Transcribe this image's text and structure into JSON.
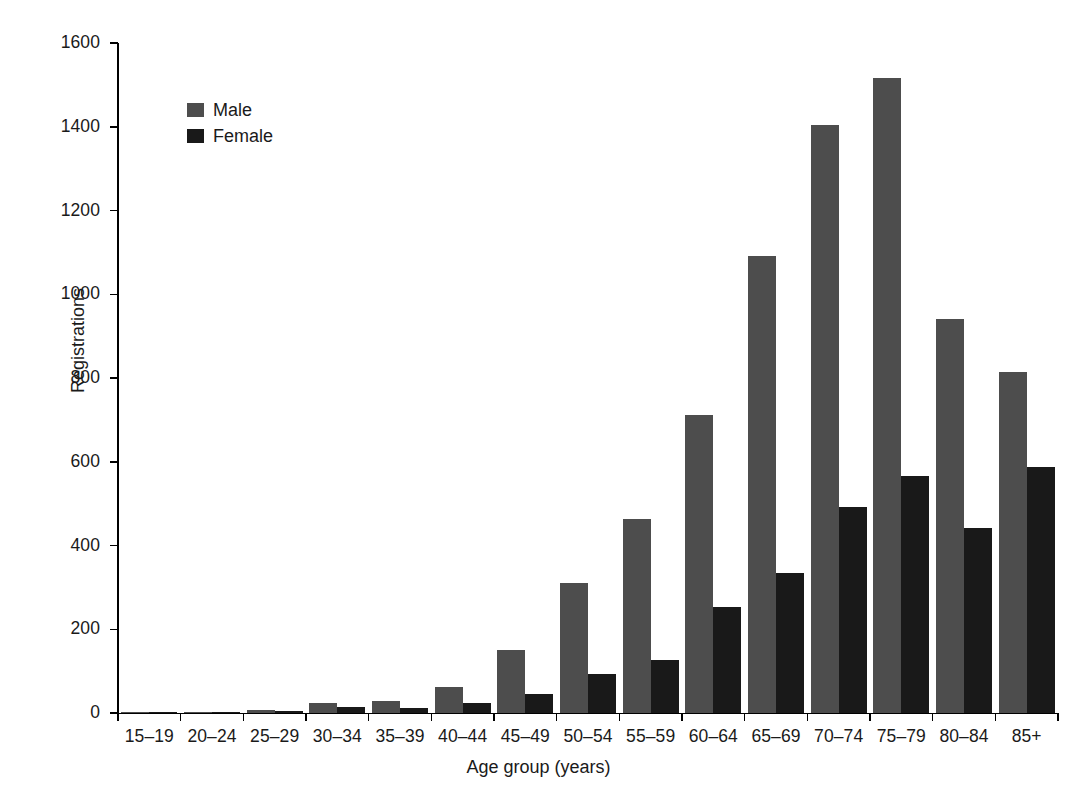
{
  "chart_data": {
    "type": "bar",
    "title": "",
    "subtitle": "",
    "xlabel": "Age group (years)",
    "ylabel": "Registrations",
    "ylim": [
      0,
      1600
    ],
    "y_ticks": [
      0,
      200,
      400,
      600,
      800,
      1000,
      1200,
      1400,
      1600
    ],
    "grid": false,
    "legend_position": "top-left-inside",
    "categories": [
      "15–19",
      "20–24",
      "25–29",
      "30–34",
      "35–39",
      "40–44",
      "45–49",
      "50–54",
      "55–59",
      "60–64",
      "65–69",
      "70–74",
      "75–79",
      "80–84",
      "85+"
    ],
    "series": [
      {
        "name": "Male",
        "color": "#4d4d4d",
        "values": [
          1,
          3,
          8,
          24,
          29,
          63,
          150,
          310,
          463,
          711,
          1092,
          1405,
          1516,
          941,
          815
        ]
      },
      {
        "name": "Female",
        "color": "#191919",
        "values": [
          1,
          3,
          4,
          15,
          13,
          25,
          45,
          93,
          126,
          254,
          334,
          493,
          565,
          441,
          587
        ]
      }
    ]
  },
  "axes": {
    "y_title": "Registrations",
    "x_title": "Age group (years)",
    "y_tick_labels": [
      "1600",
      "1400",
      "1200",
      "1000",
      "800",
      "600",
      "400",
      "200",
      "0"
    ]
  },
  "legend": {
    "items": [
      {
        "label": "Male",
        "color": "#4d4d4d"
      },
      {
        "label": "Female",
        "color": "#191919"
      }
    ]
  }
}
